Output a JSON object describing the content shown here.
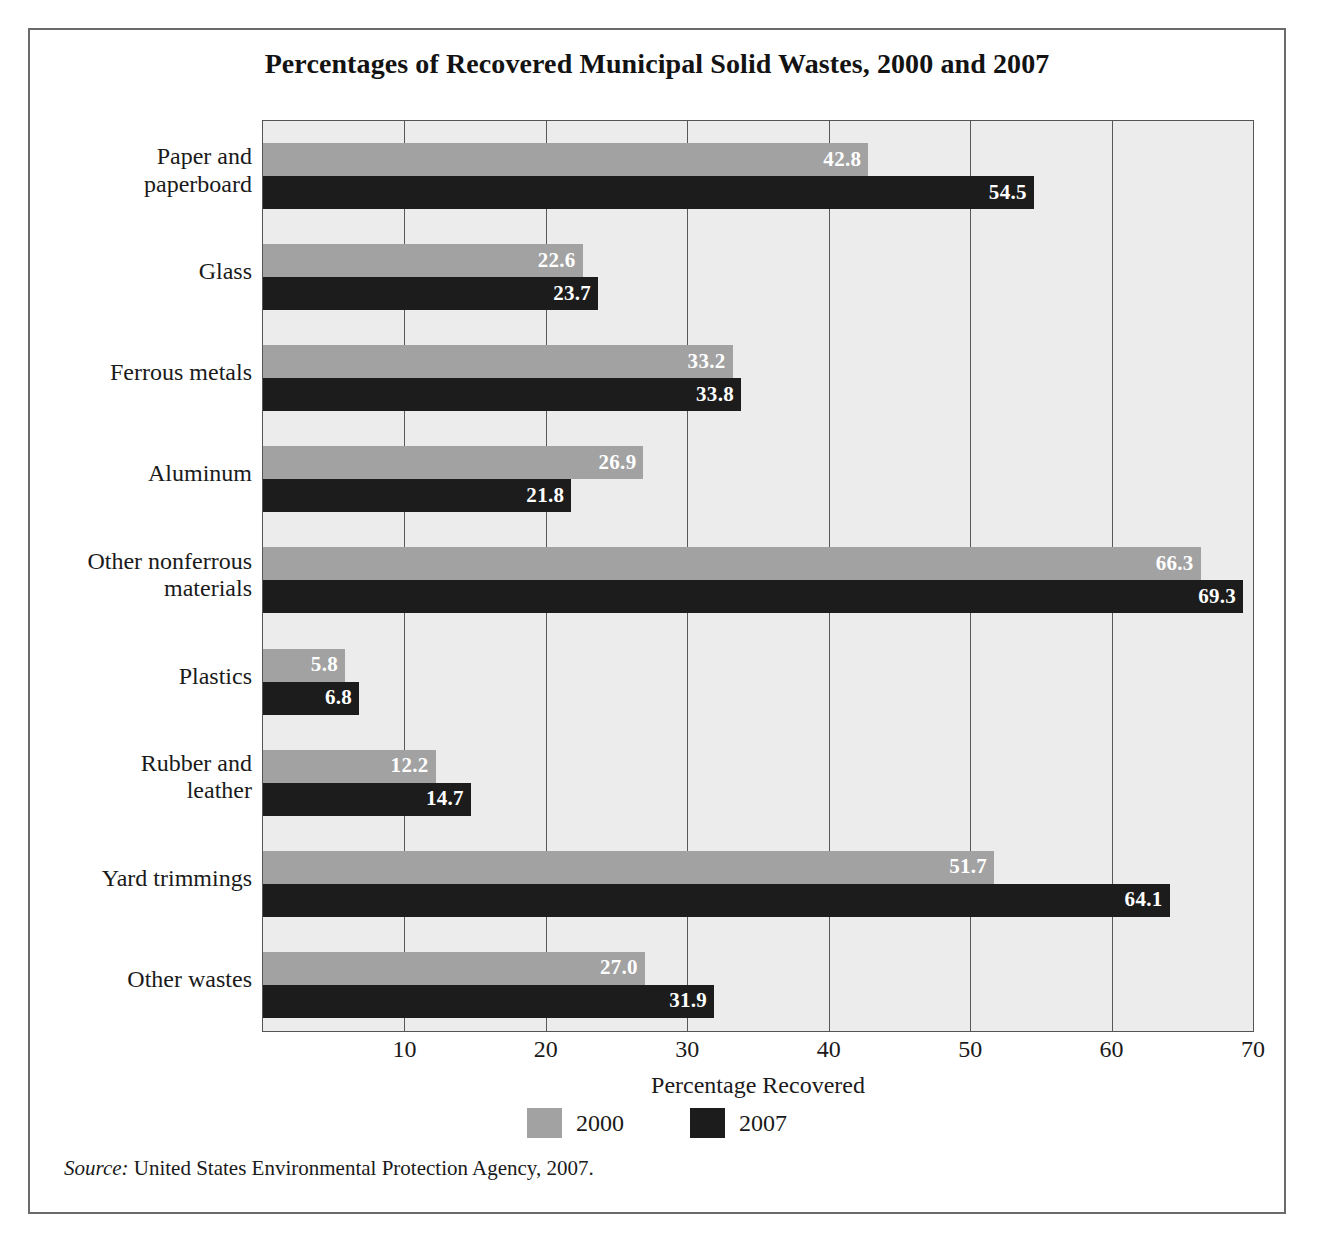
{
  "figure": {
    "title": "Percentages of Recovered Municipal Solid Wastes, 2000 and 2007",
    "source_lead": "Source:",
    "source_text": " United States Environmental Protection Agency, 2007."
  },
  "colors": {
    "series_2000": "#a2a2a2",
    "series_2007": "#1c1c1c",
    "plot_background": "#ececec",
    "gridline": "#585858",
    "frame": "#6a6a6a",
    "value_label": "#ffffff"
  },
  "legend": {
    "position": "bottom",
    "items": [
      {
        "label": "2000",
        "color_key": "series_2000"
      },
      {
        "label": "2007",
        "color_key": "series_2007"
      }
    ]
  },
  "axis": {
    "xlabel": "Percentage Recovered",
    "ticks": [
      "10",
      "20",
      "30",
      "40",
      "50",
      "60",
      "70"
    ],
    "tick_values": [
      10,
      20,
      30,
      40,
      50,
      60,
      70
    ]
  },
  "chart_data": {
    "type": "bar",
    "orientation": "horizontal",
    "title": "Percentages of Recovered Municipal Solid Wastes, 2000 and 2007",
    "xlabel": "Percentage Recovered",
    "ylabel": "",
    "xlim": [
      0,
      70
    ],
    "grid": true,
    "grid_axis": "x",
    "legend_position": "bottom",
    "categories": [
      "Paper and paperboard",
      "Glass",
      "Ferrous metals",
      "Aluminum",
      "Other nonferrous materials",
      "Plastics",
      "Rubber and leather",
      "Yard trimmings",
      "Other wastes"
    ],
    "category_lines": [
      [
        "Paper and",
        "paperboard"
      ],
      [
        "Glass"
      ],
      [
        "Ferrous metals"
      ],
      [
        "Aluminum"
      ],
      [
        "Other nonferrous",
        "materials"
      ],
      [
        "Plastics"
      ],
      [
        "Rubber and",
        "leather"
      ],
      [
        "Yard trimmings"
      ],
      [
        "Other wastes"
      ]
    ],
    "series": [
      {
        "name": "2000",
        "color": "#a2a2a2",
        "values": [
          42.8,
          22.6,
          33.2,
          26.9,
          66.3,
          5.8,
          12.2,
          51.7,
          27.0
        ],
        "labels": [
          "42.8",
          "22.6",
          "33.2",
          "26.9",
          "66.3",
          "5.8",
          "12.2",
          "51.7",
          "27.0"
        ]
      },
      {
        "name": "2007",
        "color": "#1c1c1c",
        "values": [
          54.5,
          23.7,
          33.8,
          21.8,
          69.3,
          6.8,
          14.7,
          64.1,
          31.9
        ],
        "labels": [
          "54.5",
          "23.7",
          "33.8",
          "21.8",
          "69.3",
          "6.8",
          "14.7",
          "64.1",
          "31.9"
        ]
      }
    ]
  }
}
